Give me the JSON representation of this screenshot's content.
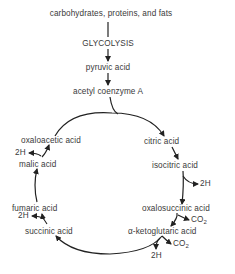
{
  "diagram": {
    "type": "metabolic-pathway",
    "inputs": {
      "source": "carbohydrates, proteins, and fats",
      "process": "GLYCOLYSIS",
      "intermediate1": "pyruvic acid",
      "intermediate2": "acetyl coenzyme A"
    },
    "cycle": {
      "citric": "citric acid",
      "isocitric": "isocitric acid",
      "oxalosuccinic": "oxalosuccinic acid",
      "ketoglutaric": "α-ketoglutaric acid",
      "succinic": "succinic acid",
      "fumaric": "fumaric acid",
      "malic": "malic acid",
      "oxaloacetic": "oxaloacetic acid"
    },
    "byproducts": {
      "h2": "2H",
      "co2_main": "CO",
      "co2_sub": "2"
    },
    "line_color": "#222222",
    "text_color": "#3a3a3a"
  }
}
